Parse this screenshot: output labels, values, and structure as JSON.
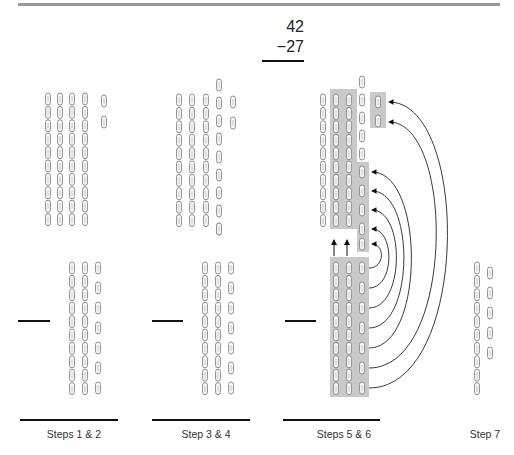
{
  "problem": {
    "minuend": "42",
    "subtrahend": "−27"
  },
  "steps": [
    {
      "label": "Steps 1 & 2",
      "top": {
        "tens": 4,
        "ones": 2
      },
      "bottom": {
        "tens": 2,
        "ones": 7
      }
    },
    {
      "label": "Step 3 & 4",
      "top": {
        "tens": 3,
        "ones": 12
      },
      "bottom": {
        "tens": 2,
        "ones": 7
      }
    },
    {
      "label": "Steps 5 & 6",
      "top": {
        "tens": 3,
        "ones": 12,
        "highlighted_tens": 2,
        "highlighted_ones": 7
      },
      "bottom": {
        "tens": 2,
        "ones": 7,
        "highlighted": true
      }
    },
    {
      "label": "Step 7",
      "result": {
        "tens": 1,
        "ones": 5
      }
    }
  ],
  "colors": {
    "clip_stroke": "#8a8a8a",
    "highlight": "#c9c9c9",
    "ink": "#111111"
  }
}
